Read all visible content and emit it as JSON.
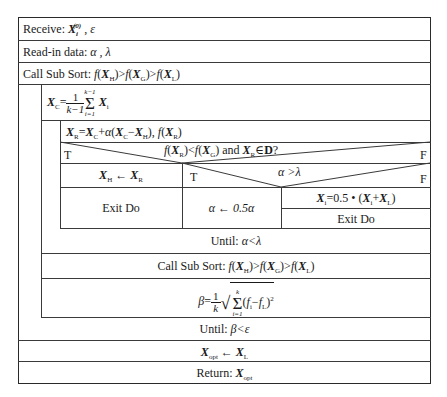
{
  "diagram": {
    "type": "Nassi-Shneiderman structogram",
    "rows": {
      "receive": {
        "label": "Receive:",
        "vars": "X_i^(0) , ε"
      },
      "readin": {
        "label": "Read-in data:",
        "vars": "α , λ"
      },
      "sort1": {
        "label": "Call Sub Sort:",
        "expr": "f(X_H)>f(X_G)>f(X_L)"
      },
      "centroid": {
        "lhs": "X_C",
        "eq": "=",
        "frac_num": "1",
        "frac_den": "k−1",
        "sum_top": "k−1",
        "sum_bottom": "i=1",
        "term": "X_i"
      },
      "reflect": {
        "expr": "X_R=X_C+α(X_C−X_H), f(X_R)"
      },
      "cond1": {
        "T": "T",
        "text": "f(X_R)<f(X_G) and X_R∈D?",
        "F": "F"
      },
      "assign_h": {
        "expr": "X_H ← X_R"
      },
      "cond2": {
        "T": "T",
        "text": "α >λ",
        "F": "F"
      },
      "exit1": {
        "label": "Exit Do"
      },
      "alpha_half": {
        "expr": "α ← 0.5α"
      },
      "shrink": {
        "expr": "X_i=0.5 • (X_i+X_L)"
      },
      "exit2": {
        "label": "Exit Do"
      },
      "until1": {
        "label": "Until:",
        "expr": "α<λ"
      },
      "sort2": {
        "label": "Call Sub Sort:",
        "expr": "f(X_H)>f(X_G)>f(X_L)"
      },
      "beta": {
        "lhs": "β",
        "eq": "=",
        "frac_num": "1",
        "frac_den": "k",
        "sum_top": "k",
        "sum_bottom": "i=1",
        "term": "(f_i−f_L)²"
      },
      "until2": {
        "label": "Until:",
        "expr": "β<ε"
      },
      "xopt": {
        "expr": "X_opt ← X_L"
      },
      "ret": {
        "label": "Return:",
        "expr": "X_opt"
      }
    },
    "colors": {
      "line": "#3a3a3a",
      "text": "#1a1a1a",
      "background": "#ffffff"
    }
  }
}
